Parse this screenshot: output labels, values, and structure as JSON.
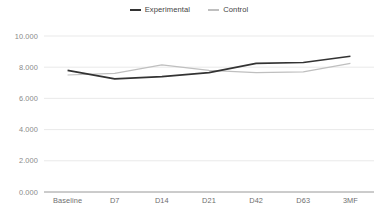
{
  "chart_data": {
    "type": "line",
    "title": "",
    "xlabel": "",
    "ylabel": "",
    "categories": [
      "Baseline",
      "D7",
      "D14",
      "D21",
      "D42",
      "D63",
      "3MF"
    ],
    "series": [
      {
        "name": "Experimental",
        "color": "#333333",
        "values": [
          7.8,
          7.25,
          7.4,
          7.65,
          8.25,
          8.3,
          8.7
        ]
      },
      {
        "name": "Control",
        "color": "#bfbfbf",
        "values": [
          7.5,
          7.6,
          8.15,
          7.8,
          7.65,
          7.7,
          8.25
        ]
      }
    ],
    "ylim": [
      0.0,
      10.0
    ],
    "yticks": [
      0.0,
      2.0,
      4.0,
      6.0,
      8.0,
      10.0
    ],
    "ytick_labels": [
      "0.000",
      "2.000",
      "4.000",
      "6.000",
      "8.000",
      "10.000"
    ],
    "grid": true,
    "legend_position": "top-center"
  },
  "legend": {
    "entries": [
      {
        "label": "Experimental",
        "color": "#333333"
      },
      {
        "label": "Control",
        "color": "#bfbfbf"
      }
    ]
  },
  "axes": {
    "y_labels": [
      "10.000",
      "8.000",
      "6.000",
      "4.000",
      "2.000",
      "0.000"
    ],
    "x_labels": [
      "Baseline",
      "D7",
      "D14",
      "D21",
      "D42",
      "D63",
      "3MF"
    ]
  },
  "colors": {
    "background": "#ffffff",
    "gridline": "#e6e6e6",
    "axis": "#8c8c8c",
    "experimental": "#333333",
    "control": "#bfbfbf",
    "y_tick_text": "#8a8a8a",
    "x_tick_text": "#6e6e6e",
    "legend_text": "#3f3f3f"
  }
}
